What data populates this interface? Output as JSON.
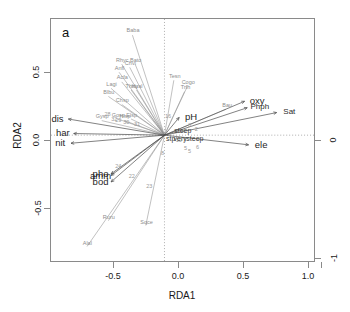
{
  "figure": {
    "panel_label": "a",
    "xlabel": "RDA1",
    "ylabel": "RDA2",
    "right_axis_labels": [
      "0",
      "-1"
    ]
  },
  "axes": {
    "x_ticks": [
      "-0.5",
      "0.0",
      "0.5",
      "1.0"
    ],
    "x_tick_values": [
      -0.5,
      0.0,
      0.5,
      1.0
    ],
    "y_ticks": [
      "0.5",
      "0.0",
      "-0.5"
    ],
    "y_tick_values": [
      0.5,
      0.0,
      -0.5
    ],
    "xlim": [
      -0.85,
      1.12
    ],
    "ylim": [
      -0.78,
      0.72
    ]
  },
  "chart_data": {
    "type": "scatter",
    "title": "",
    "subtitle": "",
    "xlabel": "RDA1",
    "ylabel": "RDA2",
    "xlim": [
      -0.85,
      1.12
    ],
    "ylim": [
      -0.78,
      0.72
    ],
    "grid": false,
    "legend": "none",
    "annotations": [
      "a"
    ],
    "species_vectors": [
      {
        "label": "Baba",
        "x": -0.24,
        "y": 0.62
      },
      {
        "label": "Rhyc",
        "x": -0.32,
        "y": 0.44
      },
      {
        "label": "Bato",
        "x": -0.22,
        "y": 0.44
      },
      {
        "label": "Anfl",
        "x": -0.34,
        "y": 0.39
      },
      {
        "label": "Chvi",
        "x": -0.26,
        "y": 0.42
      },
      {
        "label": "Acfa",
        "x": -0.32,
        "y": 0.33
      },
      {
        "label": "Lagi",
        "x": -0.4,
        "y": 0.29
      },
      {
        "label": "Thsu",
        "x": -0.25,
        "y": 0.28
      },
      {
        "label": "Hyal",
        "x": -0.21,
        "y": 0.28
      },
      {
        "label": "Blbu",
        "x": -0.42,
        "y": 0.24
      },
      {
        "label": "Chsp",
        "x": -0.32,
        "y": 0.19
      },
      {
        "label": "Gysp",
        "x": -0.47,
        "y": 0.09
      },
      {
        "label": "Gosp",
        "x": -0.35,
        "y": 0.1
      },
      {
        "label": "Hisp",
        "x": -0.3,
        "y": 0.09
      },
      {
        "label": "Elsp",
        "x": -0.25,
        "y": 0.1
      },
      {
        "label": "Tesn",
        "x": 0.07,
        "y": 0.34
      },
      {
        "label": "Cogo",
        "x": 0.17,
        "y": 0.3
      },
      {
        "label": "Trfh",
        "x": 0.15,
        "y": 0.27
      },
      {
        "label": "Bau",
        "x": 0.46,
        "y": 0.16
      },
      {
        "label": "Ruru",
        "x": -0.42,
        "y": -0.53
      },
      {
        "label": "Alal",
        "x": -0.58,
        "y": -0.69
      },
      {
        "label": "Sqce",
        "x": -0.14,
        "y": -0.56
      }
    ],
    "env_vectors": [
      {
        "label": "dis",
        "x": -0.72,
        "y": 0.1
      },
      {
        "label": "har",
        "x": -0.68,
        "y": 0.01
      },
      {
        "label": "nit",
        "x": -0.7,
        "y": -0.05
      },
      {
        "label": "oxy",
        "x": 0.6,
        "y": 0.21
      },
      {
        "label": "Phph",
        "x": 0.62,
        "y": 0.17
      },
      {
        "label": "Sat",
        "x": 0.84,
        "y": 0.14
      },
      {
        "label": "ele",
        "x": 0.63,
        "y": -0.06
      },
      {
        "label": "pH",
        "x": 0.11,
        "y": 0.11
      },
      {
        "label": "amm",
        "x": -0.4,
        "y": -0.25
      },
      {
        "label": "pho",
        "x": -0.4,
        "y": -0.24
      },
      {
        "label": "bod",
        "x": -0.4,
        "y": -0.29
      }
    ],
    "factor_labels": [
      {
        "label": "steep",
        "x": 0.13,
        "y": 0.04
      },
      {
        "label": "stp",
        "x": 0.04,
        "y": -0.01
      },
      {
        "label": "very",
        "x": 0.11,
        "y": -0.01
      },
      {
        "label": "steep",
        "x": 0.22,
        "y": -0.01
      }
    ],
    "sites": [
      {
        "label": "28",
        "x": -0.43,
        "y": 0.13
      },
      {
        "label": "32",
        "x": -0.38,
        "y": 0.1
      },
      {
        "label": "29",
        "x": -0.35,
        "y": 0.09
      },
      {
        "label": "30",
        "x": -0.29,
        "y": 0.08
      },
      {
        "label": "31",
        "x": -0.21,
        "y": 0.07
      },
      {
        "label": "16",
        "x": 0.02,
        "y": 0.12
      },
      {
        "label": "3",
        "x": 0.18,
        "y": 0.06
      },
      {
        "label": "2",
        "x": 0.23,
        "y": 0.04
      },
      {
        "label": "7",
        "x": 0.14,
        "y": -0.03
      },
      {
        "label": "5",
        "x": 0.15,
        "y": -0.08
      },
      {
        "label": "10",
        "x": 0.1,
        "y": -0.03
      },
      {
        "label": "6",
        "x": 0.24,
        "y": -0.07
      },
      {
        "label": "5",
        "x": 0.18,
        "y": -0.1
      },
      {
        "label": "8",
        "x": -0.02,
        "y": -0.11
      },
      {
        "label": "24",
        "x": -0.35,
        "y": -0.19
      },
      {
        "label": "22",
        "x": -0.25,
        "y": -0.25
      },
      {
        "label": "23",
        "x": -0.12,
        "y": -0.31
      }
    ]
  }
}
